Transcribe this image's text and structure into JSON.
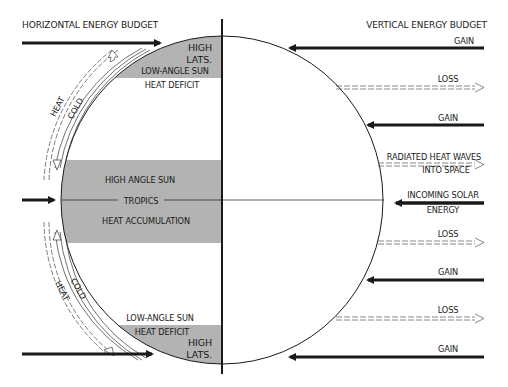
{
  "titles": {
    "horizontal": "HORIZONTAL ENERGY BUDGET",
    "vertical": "VERTICAL ENERGY BUDGET"
  },
  "left_panel": {
    "top_zone": {
      "name_line1": "HIGH",
      "name_line2": "LATS.",
      "sun": "LOW-ANGLE SUN",
      "status": "HEAT DEFICIT"
    },
    "middle_zone": {
      "sun": "HIGH ANGLE SUN",
      "name": "TROPICS",
      "status": "HEAT ACCUMULATION"
    },
    "bottom_zone": {
      "sun": "LOW-ANGLE SUN",
      "status": "HEAT DEFICIT",
      "name_line1": "HIGH",
      "name_line2": "LATS."
    },
    "flow_labels": {
      "heat_top": "HEAT",
      "cold_top": "COLD",
      "cold_bottom": "COLD",
      "heat_bottom": "HEAT"
    }
  },
  "right_panel": {
    "arrows": [
      {
        "type": "gain",
        "label": "GAIN"
      },
      {
        "type": "loss",
        "label": "LOSS"
      },
      {
        "type": "gain",
        "label": "GAIN"
      },
      {
        "type": "loss",
        "label_line1": "RADIATED HEAT WAVES",
        "label_line2": "INTO SPACE"
      },
      {
        "type": "gain",
        "label_line1": "INCOMING SOLAR",
        "label_line2": "ENERGY"
      },
      {
        "type": "loss",
        "label": "LOSS"
      },
      {
        "type": "gain",
        "label": "GAIN"
      },
      {
        "type": "loss",
        "label": "LOSS"
      },
      {
        "type": "gain",
        "label": "GAIN"
      }
    ]
  },
  "colors": {
    "shade": "#b3b3b3",
    "ink": "#1a1a1a",
    "background": "#ffffff"
  }
}
